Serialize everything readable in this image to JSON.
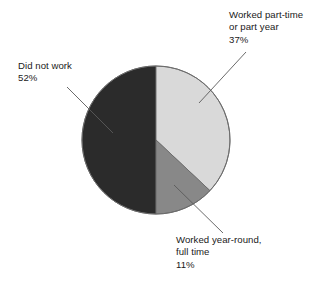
{
  "chart_data": {
    "type": "pie",
    "title": "",
    "subtitle": "",
    "xlabel": "",
    "ylabel": "",
    "legend_position": "none",
    "grid": false,
    "units": "percent",
    "total": 100,
    "categories": [
      "Did not work",
      "Worked part-time or part year",
      "Worked year-round, full time"
    ],
    "values": [
      52,
      37,
      11
    ],
    "slices": [
      {
        "name": "did-not-work",
        "label": "Did not work",
        "value": 52,
        "value_text": "52%",
        "color": "#2b2b2b",
        "start_angle_deg": 180,
        "end_angle_deg": 360
      },
      {
        "name": "worked-part-time",
        "label": "Worked part-time or part year",
        "value": 37,
        "value_text": "37%",
        "color": "#d9d9d9",
        "start_angle_deg": 0,
        "end_angle_deg": 133.2
      },
      {
        "name": "worked-year-round",
        "label": "Worked year-round, full time",
        "value": 11,
        "value_text": "11%",
        "color": "#888888",
        "start_angle_deg": 133.2,
        "end_angle_deg": 180
      }
    ]
  },
  "labels": {
    "part_time": {
      "line1": "Worked part-time",
      "line2": "or part year",
      "line3": "37%"
    },
    "did_not_work": {
      "line1": "Did not work",
      "line2": "52%"
    },
    "year_round": {
      "line1": "Worked year-round,",
      "line2": "full time",
      "line3": "11%"
    }
  },
  "colors": {
    "background": "#ffffff",
    "slice_dark": "#2b2b2b",
    "slice_light": "#d9d9d9",
    "slice_medium": "#888888",
    "outline": "#6b6b6b",
    "leader_line": "#5a5a5a",
    "text": "#1a1a1a"
  }
}
